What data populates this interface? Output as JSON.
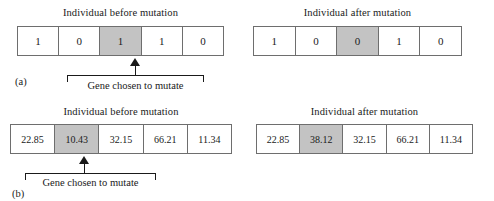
{
  "figure": {
    "background_color": "#ffffff",
    "line_color": "#6e6e6e",
    "highlight_color": "#c3c3c3",
    "text_color": "#1a1a1a"
  },
  "panels": [
    {
      "id": "a",
      "label": "(a)",
      "encoding": "binary",
      "before": {
        "caption": "Individual before mutation",
        "genes": [
          "1",
          "0",
          "1",
          "1",
          "0"
        ],
        "mutated_index": 2,
        "mutated_value": "1"
      },
      "after": {
        "caption": "Individual after mutation",
        "genes": [
          "1",
          "0",
          "0",
          "1",
          "0"
        ],
        "mutated_index": 2,
        "mutated_value": "0"
      },
      "annotation": {
        "bracket_label": "Gene chosen to mutate"
      }
    },
    {
      "id": "b",
      "label": "(b)",
      "encoding": "real",
      "before": {
        "caption": "Individual before mutation",
        "genes": [
          "22.85",
          "10.43",
          "32.15",
          "66.21",
          "11.34"
        ],
        "mutated_index": 1,
        "mutated_value": "10.43"
      },
      "after": {
        "caption": "Individual after mutation",
        "genes": [
          "22.85",
          "38.12",
          "32.15",
          "66.21",
          "11.34"
        ],
        "mutated_index": 1,
        "mutated_value": "38.12"
      },
      "annotation": {
        "bracket_label": "Gene chosen to mutate"
      }
    }
  ]
}
